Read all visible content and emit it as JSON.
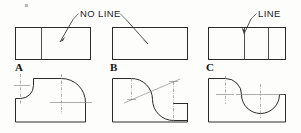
{
  "figure": {
    "background_color": "#fdfdfc",
    "line_color": "#2b2b2b",
    "centerline_color": "#7a7a7a"
  },
  "callouts": [
    {
      "id": "no-line",
      "text": "NO LINE",
      "x": 110,
      "y": 14,
      "points_to": [
        "A",
        "B"
      ]
    },
    {
      "id": "line",
      "text": "LINE",
      "x": 258,
      "y": 14,
      "points_to": [
        "C"
      ]
    }
  ],
  "cases": [
    {
      "id": "A",
      "label": "A",
      "label_x": 16,
      "label_y": 70,
      "top_view": {
        "name": "top-view-a",
        "x": 15,
        "y": 27,
        "width": 76,
        "height": 33,
        "divider_count": 1,
        "dividers": [
          0.34
        ],
        "note": "one vertical line at tangent transition"
      },
      "front_view": {
        "name": "front-view-a",
        "description": "base block with concave fillet at upper-left and large convex quarter-round at right",
        "arcs": [
          {
            "type": "concave-fillet",
            "position": "upper-left",
            "radius_px": 13
          },
          {
            "type": "convex-round",
            "position": "right",
            "radius_px": 24
          }
        ],
        "center_marks": 3
      }
    },
    {
      "id": "B",
      "label": "B",
      "label_x": 110,
      "label_y": 70,
      "top_view": {
        "name": "top-view-b",
        "x": 112,
        "y": 27,
        "width": 76,
        "height": 33,
        "divider_count": 0,
        "dividers": [],
        "note": "no internal lines; tangency produces no edge"
      },
      "front_view": {
        "name": "front-view-b",
        "description": "base block with S-curve (ogee) descending left to right",
        "arcs": [
          {
            "type": "convex",
            "position": "upper-left",
            "radius_px": 21
          },
          {
            "type": "concave",
            "position": "lower-right",
            "radius_px": 21
          }
        ],
        "center_marks": 2,
        "has_diagonal_centerline": true
      }
    },
    {
      "id": "C",
      "label": "C",
      "label_x": 206,
      "label_y": 70,
      "top_view": {
        "name": "top-view-c",
        "x": 208,
        "y": 27,
        "width": 78,
        "height": 33,
        "divider_count": 2,
        "dividers": [
          0.37,
          0.74
        ],
        "note": "two vertical lines shown"
      },
      "front_view": {
        "name": "front-view-c",
        "description": "base block with reverse curve dropping into rounded valley",
        "arcs": [
          {
            "type": "convex",
            "position": "upper-left",
            "radius_px": 16
          },
          {
            "type": "concave-valley",
            "position": "center",
            "radius_px": 19
          }
        ],
        "center_marks": 3
      }
    }
  ]
}
